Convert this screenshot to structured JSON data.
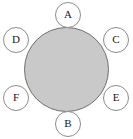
{
  "diagram": {
    "canvas": {
      "width": 133,
      "height": 139,
      "background": "#ffffff"
    },
    "hub": {
      "name": "central-disc",
      "label": "",
      "shape": "circle",
      "fill": "#c9c9c9",
      "stroke": "#6f6f6f",
      "stroke_width": 1,
      "x": 24,
      "y": 27,
      "diameter": 85
    },
    "nodes": [
      {
        "id": "node-a",
        "label": "A",
        "position": "top",
        "x": 55,
        "y": 2,
        "diameter": 26,
        "fill": "#ffffff",
        "stroke": "#8c8c8c"
      },
      {
        "id": "node-c",
        "label": "C",
        "position": "upper-right",
        "x": 103,
        "y": 27,
        "diameter": 26,
        "fill": "#ffffff",
        "stroke": "#8c8c8c"
      },
      {
        "id": "node-e",
        "label": "E",
        "position": "lower-right",
        "x": 103,
        "y": 85,
        "diameter": 26,
        "fill": "#ffffff",
        "stroke": "#8c8c8c"
      },
      {
        "id": "node-b",
        "label": "B",
        "position": "bottom",
        "x": 55,
        "y": 111,
        "diameter": 26,
        "fill": "#ffffff",
        "stroke": "#8c8c8c"
      },
      {
        "id": "node-f",
        "label": "F",
        "position": "lower-left",
        "x": 3,
        "y": 85,
        "diameter": 26,
        "fill": "#ffffff",
        "stroke": "#8c8c8c"
      },
      {
        "id": "node-d",
        "label": "D",
        "position": "upper-left",
        "x": 3,
        "y": 27,
        "diameter": 26,
        "fill": "#ffffff",
        "stroke": "#8c8c8c"
      }
    ]
  }
}
